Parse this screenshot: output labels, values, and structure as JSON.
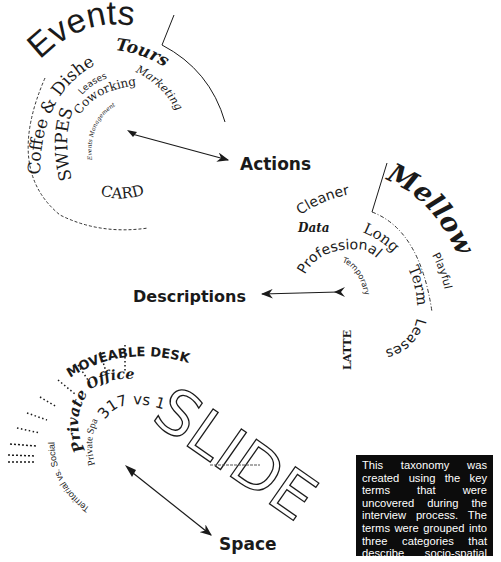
{
  "categories": {
    "actions": {
      "label": "Actions",
      "terms": [
        "Events",
        "Tours",
        "Marketing",
        "Coffee & Dishes",
        "Leases",
        "Coworking",
        "Events Management",
        "SWIPES",
        "CARD"
      ]
    },
    "descriptions": {
      "label": "Descriptions",
      "terms": [
        "Mellow",
        "Cleaner",
        "Data",
        "Long",
        "Term",
        "Leases",
        "Playful",
        "Professional",
        "Temporary",
        "LATTE"
      ]
    },
    "space": {
      "label": "Space",
      "terms": [
        "SLIDE",
        "MOVEABLE DESKS",
        "Office",
        "Private",
        "317 vs 101",
        "Private Space",
        "Territorial vs. Social"
      ]
    }
  },
  "note": {
    "text": "This taxonomy was created using the key terms that were uncovered during the interview process. The terms were grouped into three categories that describe socio-spatial characteristics of the space."
  }
}
